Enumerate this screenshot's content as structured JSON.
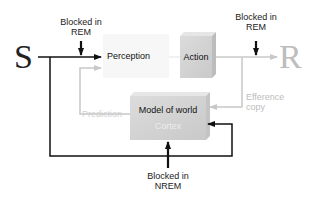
{
  "diagram": {
    "input_label": "S",
    "output_label": "R",
    "nodes": {
      "perception": {
        "label": "Perception"
      },
      "action": {
        "label": "Action"
      },
      "model": {
        "label": "Model of world",
        "sublabel": "Cortex"
      }
    },
    "annotations": {
      "blocked_rem_left": {
        "line1": "Blocked in",
        "line2": "REM"
      },
      "blocked_rem_right": {
        "line1": "Blocked in",
        "line2": "REM"
      },
      "blocked_nrem": {
        "line1": "Blocked in",
        "line2": "NREM"
      },
      "prediction": "Prediction",
      "efference": {
        "line1": "Efference",
        "line2": "copy"
      }
    },
    "colors": {
      "black_arrow": "#111111",
      "gray_arrow": "#c8c8c8",
      "box_fill": "#d4d4d4",
      "faint_text": "#bdbdbd"
    }
  }
}
